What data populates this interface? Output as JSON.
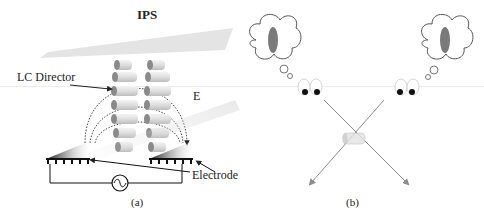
{
  "figure": {
    "panel_a": {
      "title": "IPS",
      "lc_director_label": "LC Director",
      "field_label": "E",
      "electrode_label": "Electrode",
      "caption": "(a)",
      "ac_source_icon": "ac-source-icon"
    },
    "panel_b": {
      "caption": "(b)",
      "thought_bubble_icon": "thought-bubble-icon",
      "eyes_icon": "eyes-icon"
    },
    "colors": {
      "lc_rod": "#d9d9d9",
      "lc_rod_end": "#8a8a8a",
      "polarizer_plate": "#e6e6e6",
      "ray": "#8c8c8c",
      "ellipse": "#7a7a7a",
      "line": "#222222"
    }
  }
}
